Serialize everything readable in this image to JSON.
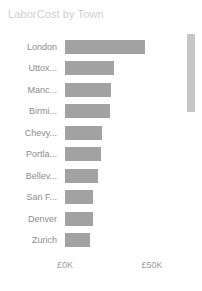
{
  "visual": {
    "title": "LaborCost by Town",
    "background_color": "#ffffff",
    "title_color": "#cfcfcf",
    "bar_color": "#a2a2a2",
    "label_color": "#8c8c8c",
    "axis_label_color": "#9a9a9a",
    "scrollbar_color": "#c6c6c6"
  },
  "scrollbar": {
    "orientation": "vertical",
    "thumb_position_percent": 0,
    "thumb_size_percent": 35
  },
  "chart_data": {
    "type": "bar",
    "orientation": "horizontal",
    "title": "LaborCost by Town",
    "xlabel": "",
    "ylabel": "",
    "grid": false,
    "legend": false,
    "currency": "GBP",
    "categories": [
      "London",
      "Uttox...",
      "Manc...",
      "Birmi...",
      "Chevy...",
      "Portla...",
      "Bellev...",
      "San F...",
      "Denver",
      "Zurich"
    ],
    "values": [
      46000,
      28000,
      26500,
      26000,
      21500,
      20500,
      19000,
      16000,
      16000,
      14500
    ],
    "xlim": [
      0,
      57000
    ],
    "xticks": [
      0,
      50000
    ],
    "xticklabels": [
      "£0K",
      "£50K"
    ],
    "series_name": "LaborCost"
  }
}
